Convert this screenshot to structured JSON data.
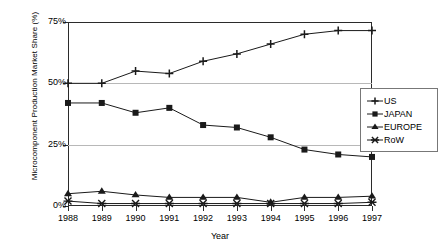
{
  "chart_data": {
    "type": "line",
    "title": "",
    "xlabel": "Year",
    "ylabel": "Microcomponent Production Market Share (%)",
    "categories": [
      "1988",
      "1989",
      "1990",
      "1991",
      "1992",
      "1993",
      "1994",
      "1995",
      "1996",
      "1997"
    ],
    "x": [
      1988,
      1989,
      1990,
      1991,
      1992,
      1993,
      1994,
      1995,
      1996,
      1997
    ],
    "ylim": [
      0,
      75
    ],
    "y_ticks": [
      "0%",
      "25%",
      "50%",
      "75%"
    ],
    "y_tick_values": [
      0,
      25,
      50,
      75
    ],
    "grid": true,
    "legend_position": "right",
    "series": [
      {
        "name": "US",
        "marker": "plus",
        "color": "#1a1a1a",
        "values": [
          50,
          50,
          55,
          54,
          59,
          62,
          66,
          70,
          71.5,
          71.5
        ]
      },
      {
        "name": "JAPAN",
        "marker": "square",
        "color": "#1a1a1a",
        "values": [
          42,
          42,
          38,
          40,
          33,
          32,
          28,
          23,
          21,
          20
        ]
      },
      {
        "name": "EUROPE",
        "marker": "triangle",
        "color": "#1a1a1a",
        "values": [
          5,
          6,
          4.5,
          3.5,
          3.5,
          3.5,
          1.5,
          3.5,
          3.5,
          4
        ]
      },
      {
        "name": "RoW",
        "marker": "x",
        "color": "#1a1a1a",
        "values": [
          2,
          1,
          1,
          1,
          1,
          1,
          1,
          1,
          1,
          1.5
        ]
      }
    ]
  },
  "legend": {
    "entries": [
      {
        "label": "US",
        "marker": "plus"
      },
      {
        "label": "JAPAN",
        "marker": "square"
      },
      {
        "label": "EUROPE",
        "marker": "triangle"
      },
      {
        "label": "RoW",
        "marker": "x"
      }
    ]
  }
}
